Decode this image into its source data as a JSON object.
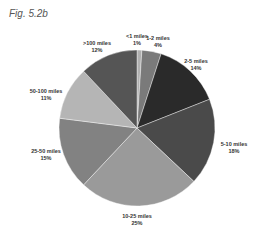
{
  "figure": {
    "title": "Fig. 5.2b"
  },
  "chart_data": {
    "type": "pie",
    "title": "Fig. 5.2b",
    "categories": [
      "<1 miles",
      "1-2 miles",
      "2-5 miles",
      "5-10 miles",
      "10-25 miles",
      "25-50 miles",
      "50-100 miles",
      ">100 miles"
    ],
    "values": [
      1,
      4,
      14,
      18,
      25,
      15,
      11,
      12
    ],
    "value_labels": [
      "1%",
      "4%",
      "14%",
      "18%",
      "25%",
      "15%",
      "11%",
      "12%"
    ],
    "colors": [
      "#b0b0b0",
      "#7a7a7a",
      "#2a2a2a",
      "#4a4a4a",
      "#9a9a9a",
      "#828282",
      "#b5b5b5",
      "#555555"
    ],
    "start_angle": "top, clockwise",
    "legend": "none (direct labels)"
  }
}
